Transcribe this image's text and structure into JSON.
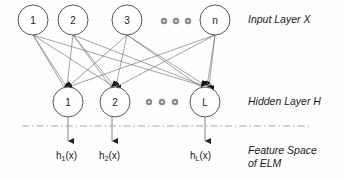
{
  "diagram": {
    "title_caption": "",
    "background_color": "#fefefe",
    "stroke_color": "#555555",
    "edge_color": "#666666",
    "separator_color": "#9aa0a6"
  },
  "input_layer": {
    "label": "Input Layer X",
    "nodes": [
      {
        "label": "1",
        "cx": 33,
        "cy": 20
      },
      {
        "label": "2",
        "cx": 73,
        "cy": 20
      },
      {
        "label": "3",
        "cx": 127,
        "cy": 20
      },
      {
        "label": "n",
        "cx": 215,
        "cy": 20
      }
    ],
    "ellipsis": {
      "cx": [
        164,
        176,
        188
      ],
      "cy": 21
    }
  },
  "hidden_layer": {
    "label": "Hidden Layer H",
    "nodes": [
      {
        "label": "1",
        "cx": 68,
        "cy": 102
      },
      {
        "label": "2",
        "cx": 115,
        "cy": 102
      },
      {
        "label": "L",
        "cx": 205,
        "cy": 102
      }
    ],
    "ellipsis": {
      "cx": [
        149,
        162,
        175
      ],
      "cy": 102
    }
  },
  "feature_space": {
    "label_line1": "Feature Space",
    "label_line2": "of ELM",
    "outputs": [
      {
        "base": "h",
        "sub": "1",
        "arg": "(x)",
        "x": 59,
        "y": 155
      },
      {
        "base": "h",
        "sub": "2",
        "arg": "(x)",
        "x": 101,
        "y": 155
      },
      {
        "base": "h",
        "sub": "L",
        "arg": "(x)",
        "x": 191,
        "y": 155
      }
    ]
  },
  "separator": {
    "y": 126,
    "x1": 22,
    "x2": 312
  }
}
